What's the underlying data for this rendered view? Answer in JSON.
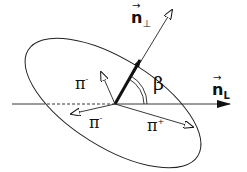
{
  "diagram": {
    "labels": {
      "n_perp": {
        "base": "n",
        "subscript": "⊥",
        "arrow": "→"
      },
      "n_L": {
        "base": "n",
        "subscript": "L",
        "arrow": "→"
      },
      "beta": "β",
      "pi_minus_upper": {
        "base": "π",
        "sup": "-"
      },
      "pi_minus_lower": {
        "base": "π",
        "sup": "-"
      },
      "pi_plus": {
        "base": "π",
        "sup": "+"
      }
    },
    "colors": {
      "stroke": "#111111",
      "background": "#ffffff"
    }
  }
}
